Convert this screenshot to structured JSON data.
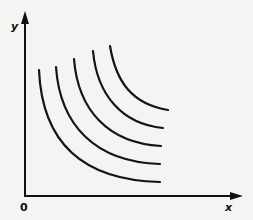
{
  "diagram": {
    "type": "family-of-convex-curves",
    "axes": {
      "y_label": "y",
      "x_label": "x",
      "origin_label": "0"
    },
    "curve_count": 5,
    "colors": {
      "background": "#f4f4f2",
      "ink": "#111111"
    }
  }
}
